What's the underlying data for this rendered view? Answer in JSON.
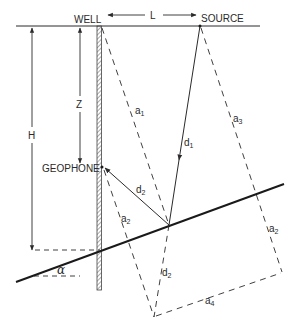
{
  "diagram": {
    "type": "seismic reflection geometry (vertical seismic profile)",
    "colors": {
      "line": "#2a2a2a",
      "background": "#ffffff"
    },
    "labels": {
      "well": "WELL",
      "source": "SOURCE",
      "geophone": "GEOPHONE",
      "L": "L",
      "Z": "Z",
      "H": "H",
      "alpha": "α",
      "a1": {
        "base": "a",
        "sub": "1"
      },
      "a2_left": {
        "base": "a",
        "sub": "2"
      },
      "a2_right": {
        "base": "a",
        "sub": "2"
      },
      "a3": {
        "base": "a",
        "sub": "3"
      },
      "a4": {
        "base": "a",
        "sub": "4"
      },
      "d1": {
        "base": "d",
        "sub": "1"
      },
      "d2_ray": {
        "base": "d",
        "sub": "2"
      },
      "d2_image": {
        "base": "d",
        "sub": "2"
      }
    },
    "elements": [
      "surface line",
      "borehole (well) with hatching",
      "dipping reflector at angle alpha",
      "incident ray d1 from source to reflector",
      "reflected ray d2 from reflector to geophone",
      "image ray d2 (dashed) to mirror image point",
      "construction lines a1, a2, a3, a4 (dashed)",
      "distance arrows L, Z, H"
    ]
  }
}
